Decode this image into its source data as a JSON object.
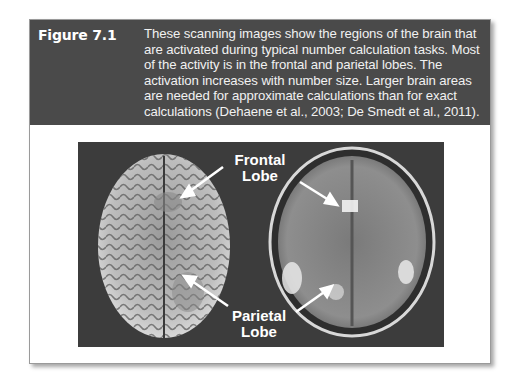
{
  "figure": {
    "label": "Figure 7.1",
    "caption": "These scanning images show the regions of the brain that are activated during typical number calculation tasks. Most of the activity is in the frontal and parietal lobes. The activation increases with number size. Larger brain areas are needed for approximate calculations than for exact calculations (Dehaene et al., 2003; De Smedt et al., 2011).",
    "annotations": {
      "frontal_line1": "Frontal",
      "frontal_line2": "Lobe",
      "parietal_line1": "Parietal",
      "parietal_line2": "Lobe"
    },
    "images": [
      "brain-surface-top-view",
      "brain-axial-mri-scan"
    ]
  }
}
